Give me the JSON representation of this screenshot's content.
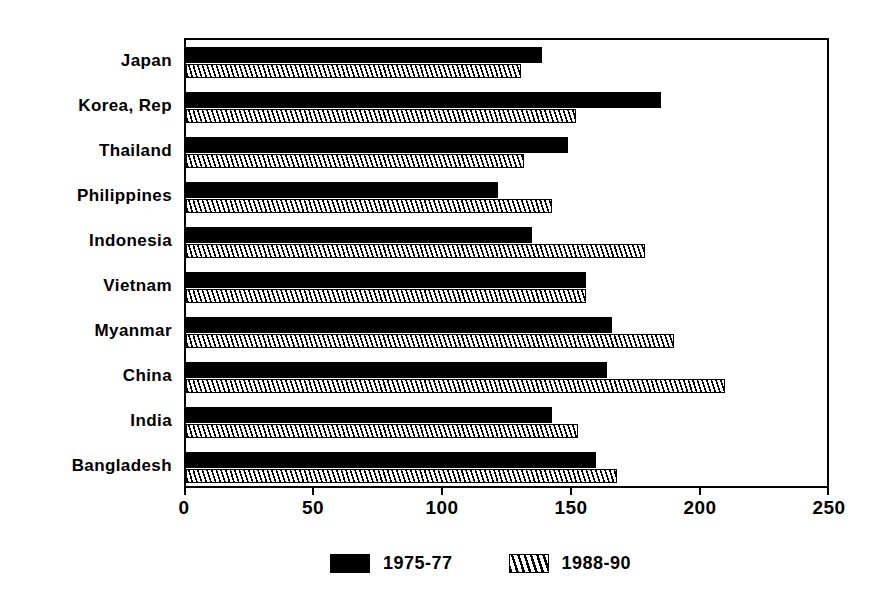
{
  "chart_data": {
    "type": "bar",
    "orientation": "horizontal",
    "title": "",
    "xlabel": "",
    "ylabel": "",
    "xlim": [
      0,
      250
    ],
    "xticks": [
      0,
      50,
      100,
      150,
      200,
      250
    ],
    "xtick_labels": [
      "0",
      "50",
      "100",
      "150",
      "200",
      "250"
    ],
    "grid": false,
    "legend_position": "bottom-center",
    "categories": [
      "Japan",
      "Korea, Rep",
      "Thailand",
      "Philippines",
      "Indonesia",
      "Vietnam",
      "Myanmar",
      "China",
      "India",
      "Bangladesh"
    ],
    "series": [
      {
        "name": "1975-77",
        "fill": "solid-black",
        "color": "#000000",
        "values": [
          138,
          184,
          148,
          121,
          134,
          155,
          165,
          163,
          142,
          159
        ]
      },
      {
        "name": "1988-90",
        "fill": "diagonal-hatch",
        "color": "#000000",
        "values": [
          130,
          151,
          131,
          142,
          178,
          155,
          189,
          209,
          152,
          167
        ]
      }
    ]
  },
  "legend": {
    "entries": [
      {
        "label": "1975-77",
        "fill": "solid"
      },
      {
        "label": "1988-90",
        "fill": "hatch"
      }
    ]
  },
  "axis": {
    "ticks": [
      "0",
      "50",
      "100",
      "150",
      "200",
      "250"
    ]
  }
}
